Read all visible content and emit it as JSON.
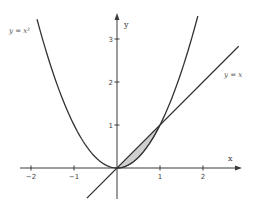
{
  "chart_data": {
    "type": "line",
    "title": "",
    "xlabel": "x",
    "ylabel": "y",
    "xlim": [
      -2.2,
      2.85
    ],
    "ylim": [
      -0.7,
      3.6
    ],
    "grid": false,
    "legend": "none",
    "x_ticks": [
      -2,
      -1,
      1,
      2
    ],
    "x_tick_labels": [
      "−2",
      "−1",
      "1",
      "2"
    ],
    "y_ticks": [
      1,
      2,
      3
    ],
    "y_tick_labels": [
      "1",
      "2",
      "3"
    ],
    "series": [
      {
        "name": "y = x²",
        "function": "x^2",
        "x_range": [
          -1.86,
          1.88
        ],
        "sample_points": [
          [
            -1.86,
            3.46
          ],
          [
            -1.5,
            2.25
          ],
          [
            -1,
            1
          ],
          [
            -0.5,
            0.25
          ],
          [
            0,
            0
          ],
          [
            0.5,
            0.25
          ],
          [
            1,
            1
          ],
          [
            1.5,
            2.25
          ],
          [
            1.88,
            3.53
          ]
        ]
      },
      {
        "name": "y = x",
        "function": "x",
        "x_range": [
          -0.7,
          2.83
        ],
        "sample_points": [
          [
            -0.7,
            -0.7
          ],
          [
            0,
            0
          ],
          [
            1,
            1
          ],
          [
            2,
            2
          ],
          [
            2.83,
            2.83
          ]
        ]
      }
    ],
    "shaded_region": {
      "description": "Area between y = x and y = x² from x = 0 to x = 1",
      "x_range": [
        0,
        1
      ],
      "upper": "x",
      "lower": "x^2",
      "fill_color": "#cfcfcf"
    },
    "annotations": [
      {
        "text": "y = x²",
        "near": "upper-left end of parabola"
      },
      {
        "text": "y = x",
        "near": "upper-right end of line"
      }
    ],
    "intersection_points": [
      [
        0,
        0
      ],
      [
        1,
        1
      ]
    ]
  },
  "labels": {
    "x_axis": "x",
    "y_axis": "y",
    "parabola": "y = x²",
    "line": "y = x",
    "xticks": [
      "−2",
      "−1",
      "1",
      "2"
    ],
    "yticks": [
      "1",
      "2",
      "3"
    ]
  },
  "colors": {
    "curve": "#333333",
    "shade": "#cfcfcf",
    "axis": "#3a3a3a",
    "text": "#444444"
  }
}
